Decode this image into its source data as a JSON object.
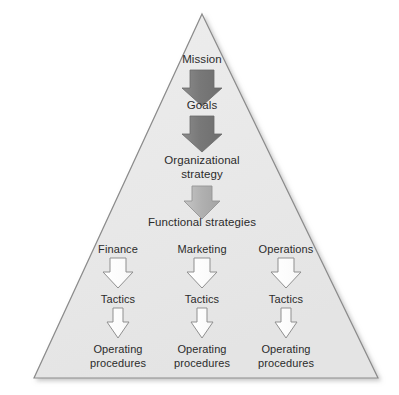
{
  "diagram": {
    "type": "pyramid-hierarchy",
    "title": "",
    "shape": {
      "name": "triangle",
      "fill": "#e9e9e9",
      "stroke": "#8b8b8b",
      "apex": [
        202,
        14
      ],
      "bottom_left": [
        34,
        378
      ],
      "bottom_right": [
        378,
        378
      ]
    },
    "colors": {
      "triangle_fill": "#e9e9e9",
      "triangle_stroke": "#8b8b8b",
      "arrow_dark": "#7c7c7c",
      "arrow_medium": "#b3b3b3",
      "arrow_light": "#ffffff",
      "arrow_outline": "#8f8f8f",
      "text": "#2b2b2b"
    },
    "levels": [
      {
        "id": "mission",
        "label": "Mission"
      },
      {
        "id": "goals",
        "label": "Goals"
      },
      {
        "id": "organizational-strategy",
        "label": "Organizational\nstrategy"
      },
      {
        "id": "functional-strategies",
        "label": "Functional strategies"
      }
    ],
    "columns": [
      {
        "id": "finance",
        "label": "Finance",
        "tactics_label": "Tactics",
        "procedures_label": "Operating\nprocedures"
      },
      {
        "id": "marketing",
        "label": "Marketing",
        "tactics_label": "Tactics",
        "procedures_label": "Operating\nprocedures"
      },
      {
        "id": "operations",
        "label": "Operations",
        "tactics_label": "Tactics",
        "procedures_label": "Operating\nprocedures"
      }
    ],
    "arrows": [
      {
        "id": "mission-to-goals",
        "style": "dark",
        "from": "mission",
        "to": "goals"
      },
      {
        "id": "goals-to-organizational-strategy",
        "style": "dark",
        "from": "goals",
        "to": "organizational-strategy"
      },
      {
        "id": "organizational-strategy-to-functional-strategies",
        "style": "medium",
        "from": "organizational-strategy",
        "to": "functional-strategies"
      },
      {
        "id": "finance-to-tactics",
        "style": "light",
        "from": "finance",
        "to": "finance-tactics"
      },
      {
        "id": "marketing-to-tactics",
        "style": "light",
        "from": "marketing",
        "to": "marketing-tactics"
      },
      {
        "id": "operations-to-tactics",
        "style": "light",
        "from": "operations",
        "to": "operations-tactics"
      },
      {
        "id": "finance-tactics-to-procedures",
        "style": "light-narrow",
        "from": "finance-tactics",
        "to": "finance-procedures"
      },
      {
        "id": "marketing-tactics-to-procedures",
        "style": "light-narrow",
        "from": "marketing-tactics",
        "to": "marketing-procedures"
      },
      {
        "id": "operations-tactics-to-procedures",
        "style": "light-narrow",
        "from": "operations-tactics",
        "to": "operations-procedures"
      }
    ]
  }
}
